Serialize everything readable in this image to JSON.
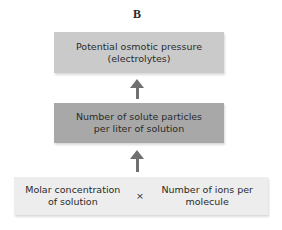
{
  "diagram": {
    "title": "B",
    "nodes": [
      {
        "id": "top",
        "line1": "Potential osmotic pressure",
        "line2": "(electrolytes)",
        "color": "#cacaca"
      },
      {
        "id": "middle",
        "line1": "Number of solute particles",
        "line2": "per liter of solution",
        "color": "#a8a8a8"
      },
      {
        "id": "bottom",
        "color": "#ededed",
        "left": {
          "line1": "Molar concentration",
          "line2": "of solution"
        },
        "operator": "×",
        "right": {
          "line1": "Number of ions per",
          "line2": "molecule"
        }
      }
    ],
    "edges": [
      {
        "from": "bottom",
        "to": "middle"
      },
      {
        "from": "middle",
        "to": "top"
      }
    ],
    "arrow_color": "#707070"
  }
}
